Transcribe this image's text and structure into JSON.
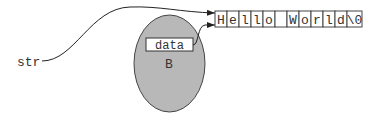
{
  "diagram": {
    "variable_label": "str",
    "object": {
      "label": "B",
      "fill": "#b8b8b8",
      "field": {
        "label": "data"
      }
    },
    "string_cells": [
      "H",
      "e",
      "l",
      "l",
      "o",
      " ",
      "W",
      "o",
      "r",
      "l",
      "d",
      "\\0"
    ],
    "pointers": [
      {
        "from": "str",
        "to": "string_cells"
      },
      {
        "from": "data",
        "to": "string_cells"
      }
    ]
  }
}
